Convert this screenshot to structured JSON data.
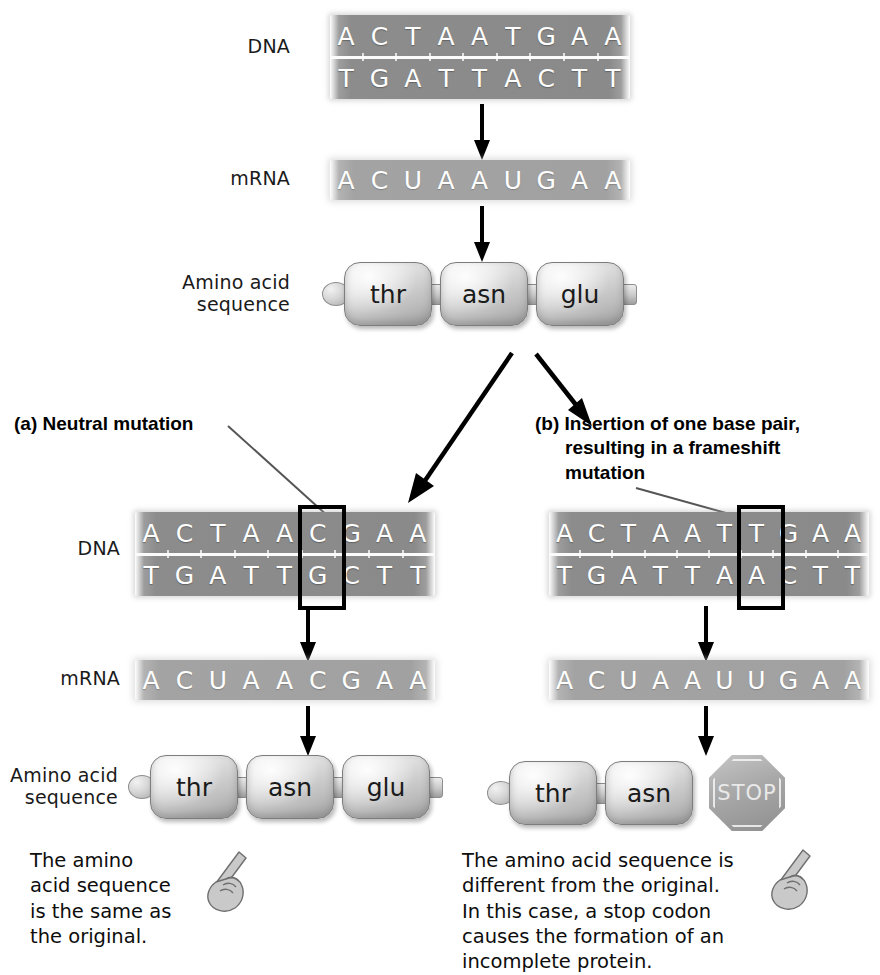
{
  "figure": {
    "type": "biology-diagram"
  },
  "labels": {
    "dna": "DNA",
    "mrna": "mRNA",
    "amino_acid_line1": "Amino acid",
    "amino_acid_line2": "sequence"
  },
  "original": {
    "dna_top": [
      "A",
      "C",
      "T",
      "A",
      "A",
      "T",
      "G",
      "A",
      "A"
    ],
    "dna_bottom": [
      "T",
      "G",
      "A",
      "T",
      "T",
      "A",
      "C",
      "T",
      "T"
    ],
    "mrna": [
      "A",
      "C",
      "U",
      "A",
      "A",
      "U",
      "G",
      "A",
      "A"
    ],
    "amino_acids": [
      "thr",
      "asn",
      "glu"
    ]
  },
  "panel_a": {
    "letter": "(a)",
    "title": "Neutral mutation",
    "heading_full": "(a) Neutral mutation",
    "dna_top": [
      "A",
      "C",
      "T",
      "A",
      "A",
      "C",
      "G",
      "A",
      "A"
    ],
    "dna_bottom": [
      "T",
      "G",
      "A",
      "T",
      "T",
      "G",
      "C",
      "T",
      "T"
    ],
    "mutated_index": 5,
    "mrna": [
      "A",
      "C",
      "U",
      "A",
      "A",
      "C",
      "G",
      "A",
      "A"
    ],
    "amino_acids": [
      "thr",
      "asn",
      "glu"
    ],
    "caption_lines": [
      "The amino",
      "acid sequence",
      "is the same as",
      "the original."
    ]
  },
  "panel_b": {
    "letter": "(b)",
    "title": "Insertion of one base pair, resulting in a frameshift mutation",
    "heading_lines": [
      "(b) Insertion of one base pair,",
      "resulting in a frameshift",
      "mutation"
    ],
    "dna_top": [
      "A",
      "C",
      "T",
      "A",
      "A",
      "T",
      "T",
      "G",
      "A",
      "A"
    ],
    "dna_bottom": [
      "T",
      "G",
      "A",
      "T",
      "T",
      "A",
      "A",
      "C",
      "T",
      "T"
    ],
    "mutated_index": 6,
    "mrna": [
      "A",
      "C",
      "U",
      "A",
      "A",
      "U",
      "U",
      "G",
      "A",
      "A"
    ],
    "amino_acids": [
      "thr",
      "asn"
    ],
    "stop_label": "STOP",
    "caption_lines": [
      "The amino acid sequence is",
      "different from the original.",
      "In this case, a stop codon",
      "causes the  formation of an",
      "incomplete protein."
    ]
  },
  "colors": {
    "dna_bar": "#8c8c8c",
    "mrna_bar": "#a3a3a3",
    "base_text": "#ffffff",
    "mutation_box_border": "#000000",
    "background": "#ffffff",
    "text": "#111111"
  }
}
